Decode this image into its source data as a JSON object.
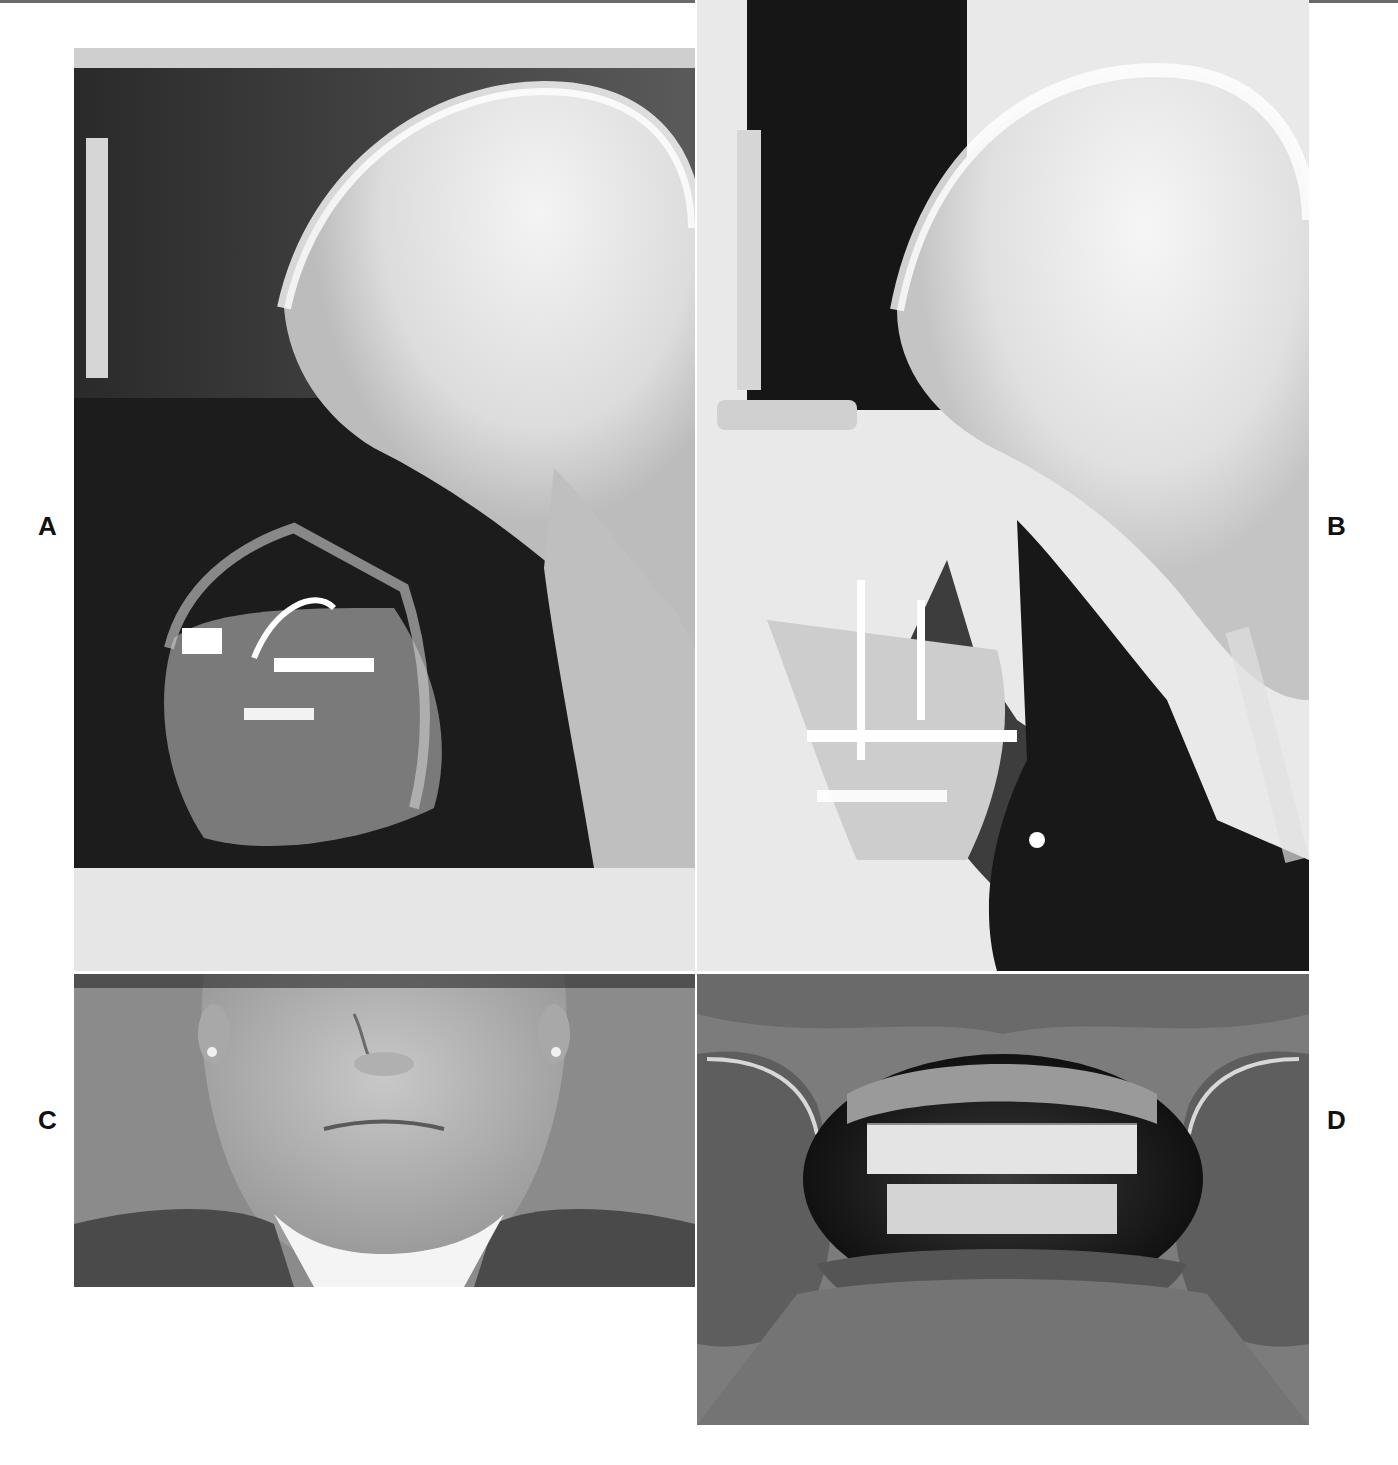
{
  "figure": {
    "panels": [
      {
        "id": "A",
        "label": "A",
        "description": "Lateral cephalometric radiograph, pre-treatment"
      },
      {
        "id": "B",
        "label": "B",
        "description": "Lateral cephalometric radiograph, post-treatment with fixation plates"
      },
      {
        "id": "C",
        "label": "C",
        "description": "Frontal facial photograph, lower face"
      },
      {
        "id": "D",
        "label": "D",
        "description": "Intraoral frontal photograph with cheek retractors"
      }
    ]
  },
  "colors": {
    "background": "#ffffff",
    "label": "#111111",
    "xray_dark": "#141414",
    "xray_light": "#f2f2f2",
    "photo_backdrop": "#8d8d8d"
  }
}
